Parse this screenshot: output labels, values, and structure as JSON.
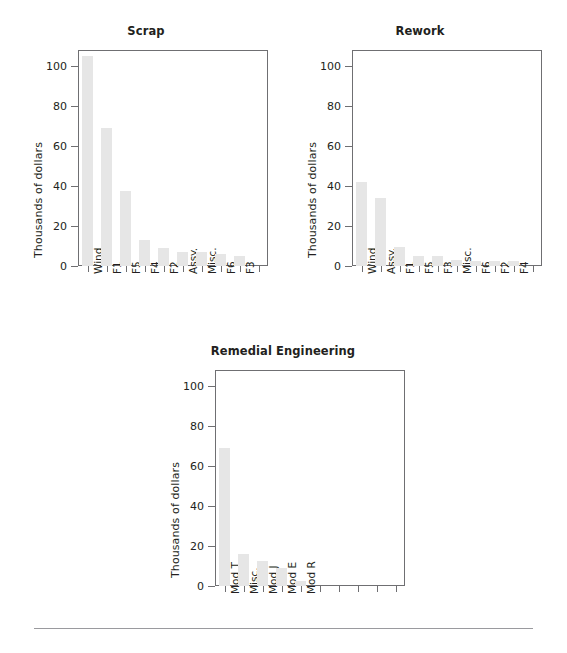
{
  "figure": {
    "units_label": "Thousands of dollars",
    "y_axis": {
      "min": 0,
      "max": 108,
      "ticks": [
        0,
        20,
        40,
        60,
        80,
        100
      ]
    },
    "x_slot_count": 10
  },
  "chart_data": [
    {
      "type": "bar",
      "title": "Scrap",
      "xlabel": "",
      "ylabel": "Thousands of dollars",
      "ylim": [
        0,
        108
      ],
      "yticks": [
        0,
        20,
        40,
        60,
        80,
        100
      ],
      "grid": false,
      "legend": "none",
      "categories": [
        "Wind",
        "F1",
        "F5",
        "F4",
        "F2",
        "Assy.",
        "Misc.",
        "F6",
        "F3"
      ],
      "values": [
        105,
        69,
        37.5,
        13,
        9,
        7,
        7,
        6,
        5
      ]
    },
    {
      "type": "bar",
      "title": "Rework",
      "xlabel": "",
      "ylabel": "Thousands of dollars",
      "ylim": [
        0,
        108
      ],
      "yticks": [
        0,
        20,
        40,
        60,
        80,
        100
      ],
      "grid": false,
      "legend": "none",
      "categories": [
        "Wind",
        "Assy.",
        "F1",
        "F5",
        "F3",
        "Misc.",
        "F6",
        "F2",
        "F4"
      ],
      "values": [
        42,
        34,
        9.5,
        5,
        5,
        3,
        2.5,
        2.5,
        2.5
      ]
    },
    {
      "type": "bar",
      "title": "Remedial Engineering",
      "xlabel": "",
      "ylabel": "Thousands of dollars",
      "ylim": [
        0,
        108
      ],
      "yticks": [
        0,
        20,
        40,
        60,
        80,
        100
      ],
      "grid": false,
      "legend": "none",
      "categories": [
        "Mod T",
        "Misc.",
        "Mod J",
        "Mod E",
        "Mod R"
      ],
      "values": [
        69,
        16,
        12.5,
        9,
        2.5
      ]
    }
  ]
}
